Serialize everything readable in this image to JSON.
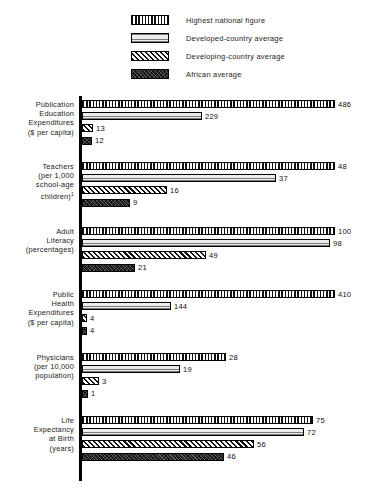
{
  "legend": {
    "items": [
      {
        "label": "Highest national figure",
        "pattern": "vertical-stripes",
        "series_key": "highest_national"
      },
      {
        "label": "Developed-country average",
        "pattern": "horizontal-stripes",
        "series_key": "developed"
      },
      {
        "label": "Developing-country average",
        "pattern": "diagonal-stripes",
        "series_key": "developing"
      },
      {
        "label": "African average",
        "pattern": "dark-crosshatch",
        "series_key": "african"
      }
    ]
  },
  "chart_data": {
    "type": "bar",
    "orientation": "horizontal",
    "title": "",
    "subtitle": "",
    "xlabel": "",
    "ylabel": "",
    "grid": false,
    "legend_position": "top",
    "note": "Each indicator group is scaled independently; bar lengths are relative within each group.",
    "series": [
      {
        "name": "Highest national figure",
        "pattern": "vertical-stripes",
        "values": [
          486,
          48,
          100,
          410,
          28,
          75
        ]
      },
      {
        "name": "Developed-country average",
        "pattern": "horizontal-stripes",
        "values": [
          229,
          37,
          98,
          144,
          19,
          72
        ]
      },
      {
        "name": "Developing-country average",
        "pattern": "diagonal-stripes",
        "values": [
          13,
          16,
          49,
          4,
          3,
          56
        ]
      },
      {
        "name": "African average",
        "pattern": "dark-crosshatch",
        "values": [
          12,
          9,
          21,
          4,
          1,
          46
        ]
      }
    ],
    "categories": [
      "Publication Education Expenditures ($ per capita)",
      "Teachers (per 1,000 school-age children)",
      "Adult Literacy (percentages)",
      "Public Health Expenditures ($ per capita)",
      "Physicians (per 10,000 population)",
      "Life Expectancy at Birth (years)"
    ],
    "groups": [
      {
        "label_lines": [
          "Publication",
          "Education",
          "Expenditures",
          "($ per capita)"
        ],
        "footnote_marker": "",
        "top": 4,
        "bars": [
          {
            "series": "Highest national figure",
            "value": 486,
            "value_text": "486",
            "pattern": "vertical-stripes",
            "width_px": 253
          },
          {
            "series": "Developed-country average",
            "value": 229,
            "value_text": "229",
            "pattern": "horizontal-stripes",
            "width_px": 120
          },
          {
            "series": "Developing-country average",
            "value": 13,
            "value_text": "13",
            "pattern": "diagonal-stripes",
            "width_px": 11
          },
          {
            "series": "African average",
            "value": 12,
            "value_text": "12",
            "pattern": "dark-crosshatch",
            "width_px": 10
          }
        ]
      },
      {
        "label_lines": [
          "Teachers",
          "(per 1,000",
          "school-age",
          "children)"
        ],
        "footnote_marker": "1",
        "top": 66,
        "bars": [
          {
            "series": "Highest national figure",
            "value": 48,
            "value_text": "48",
            "pattern": "vertical-stripes",
            "width_px": 253
          },
          {
            "series": "Developed-country average",
            "value": 37,
            "value_text": "37",
            "pattern": "horizontal-stripes",
            "width_px": 194
          },
          {
            "series": "Developing-country average",
            "value": 16,
            "value_text": "16",
            "pattern": "diagonal-stripes",
            "width_px": 85
          },
          {
            "series": "African average",
            "value": 9,
            "value_text": "9",
            "pattern": "dark-crosshatch",
            "width_px": 48
          }
        ]
      },
      {
        "label_lines": [
          "Adult",
          "Literacy",
          "(percentages)"
        ],
        "footnote_marker": "",
        "top": 131,
        "bars": [
          {
            "series": "Highest national figure",
            "value": 100,
            "value_text": "100",
            "pattern": "vertical-stripes",
            "width_px": 253
          },
          {
            "series": "Developed-country average",
            "value": 98,
            "value_text": "98",
            "pattern": "horizontal-stripes",
            "width_px": 248
          },
          {
            "series": "Developing-country average",
            "value": 49,
            "value_text": "49",
            "pattern": "diagonal-stripes",
            "width_px": 124
          },
          {
            "series": "African average",
            "value": 21,
            "value_text": "21",
            "pattern": "dark-crosshatch",
            "width_px": 53
          }
        ]
      },
      {
        "label_lines": [
          "Public",
          "Health",
          "Expenditures",
          "($ per capita)"
        ],
        "footnote_marker": "",
        "top": 194,
        "bars": [
          {
            "series": "Highest national figure",
            "value": 410,
            "value_text": "410",
            "pattern": "vertical-stripes",
            "width_px": 253
          },
          {
            "series": "Developed-country average",
            "value": 144,
            "value_text": "144",
            "pattern": "horizontal-stripes",
            "width_px": 89
          },
          {
            "series": "Developing-country average",
            "value": 4,
            "value_text": "4",
            "pattern": "diagonal-stripes",
            "width_px": 5
          },
          {
            "series": "African average",
            "value": 4,
            "value_text": "4",
            "pattern": "dark-crosshatch",
            "width_px": 5
          }
        ]
      },
      {
        "label_lines": [
          "Physicians",
          "(per 10,000",
          "population)"
        ],
        "footnote_marker": "",
        "top": 257,
        "bars": [
          {
            "series": "Highest national figure",
            "value": 28,
            "value_text": "28",
            "pattern": "vertical-stripes",
            "width_px": 144
          },
          {
            "series": "Developed-country average",
            "value": 19,
            "value_text": "19",
            "pattern": "horizontal-stripes",
            "width_px": 98
          },
          {
            "series": "Developing-country average",
            "value": 3,
            "value_text": "3",
            "pattern": "diagonal-stripes",
            "width_px": 17
          },
          {
            "series": "African average",
            "value": 1,
            "value_text": "1",
            "pattern": "dark-crosshatch",
            "width_px": 6
          }
        ]
      },
      {
        "label_lines": [
          "Life",
          "Expectancy",
          "at Birth",
          "(years)"
        ],
        "footnote_marker": "",
        "top": 320,
        "bars": [
          {
            "series": "Highest national figure",
            "value": 75,
            "value_text": "75",
            "pattern": "vertical-stripes",
            "width_px": 231
          },
          {
            "series": "Developed-country average",
            "value": 72,
            "value_text": "72",
            "pattern": "horizontal-stripes",
            "width_px": 222
          },
          {
            "series": "Developing-country average",
            "value": 56,
            "value_text": "56",
            "pattern": "diagonal-stripes",
            "width_px": 172
          },
          {
            "series": "African average",
            "value": 46,
            "value_text": "46",
            "pattern": "dark-crosshatch",
            "width_px": 142
          }
        ]
      }
    ]
  },
  "colors": {
    "ink": "#111111",
    "background": "#ffffff",
    "axis": "#000000",
    "developed_fill": "#e8e8e8"
  }
}
